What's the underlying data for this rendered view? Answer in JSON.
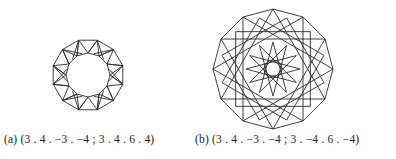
{
  "figures": [
    {
      "id": "a",
      "caption": "(a) (3 . 4 . −3 . −4 ; 3 . 4 . 6 . 4)",
      "center": [
        88,
        75
      ],
      "outer_radius": 36,
      "inner_radius": 22,
      "sides": 12
    },
    {
      "id": "b",
      "caption": "(b) (3 . 4 . −3 . −4 ; 3 . −4 . 6 . −4)",
      "center": [
        273,
        69
      ],
      "outer_radius": 60,
      "inner_radius": 9,
      "sides": 12
    }
  ],
  "colors": {
    "stroke": "#2a2a2a",
    "background": "#ffffff",
    "text": "#222222"
  }
}
